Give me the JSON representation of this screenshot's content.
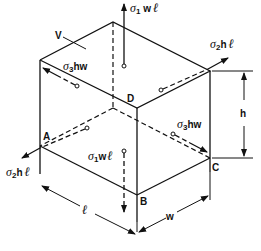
{
  "figure": {
    "vertices": {
      "A": "A",
      "B": "B",
      "C": "C",
      "D": "D"
    },
    "volume_label": "V",
    "dimensions": {
      "height": "h",
      "width": "w",
      "length": "ℓ"
    },
    "forces": {
      "sigma1_top": {
        "sym": "σ",
        "sub": "1",
        "rest": " w",
        "ell": "ℓ"
      },
      "sigma1_bottom": {
        "sym": "σ",
        "sub": "1",
        "rest": "w",
        "ell": "ℓ"
      },
      "sigma2_right": {
        "sym": "σ",
        "sub": "2",
        "rest": "h",
        "ell": "ℓ"
      },
      "sigma2_left": {
        "sym": "σ",
        "sub": "2",
        "rest": "h",
        "ell": "ℓ"
      },
      "sigma3_back": {
        "sym": "σ",
        "sub": "3",
        "rest": "hw"
      },
      "sigma3_front": {
        "sym": "σ",
        "sub": "3",
        "rest": "hw"
      }
    }
  }
}
